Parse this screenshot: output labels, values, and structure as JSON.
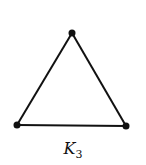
{
  "graph": {
    "name": "K",
    "subscript": "3",
    "vertices": [
      {
        "id": "top",
        "x": 72,
        "y": 33
      },
      {
        "id": "bottom-left",
        "x": 17,
        "y": 125
      },
      {
        "id": "bottom-right",
        "x": 126,
        "y": 126
      }
    ],
    "edges": [
      [
        "top",
        "bottom-left"
      ],
      [
        "top",
        "bottom-right"
      ],
      [
        "bottom-left",
        "bottom-right"
      ]
    ],
    "stroke_color": "#111111"
  }
}
